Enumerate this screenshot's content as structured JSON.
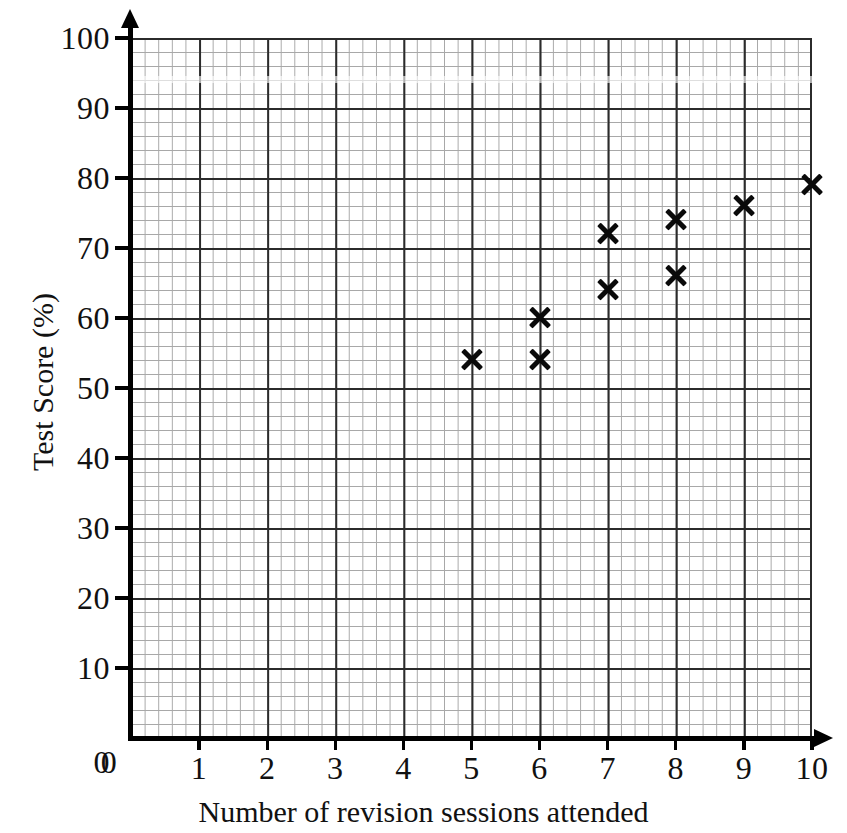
{
  "chart_data": {
    "type": "scatter",
    "title": "",
    "xlabel": "Number of revision sessions attended",
    "ylabel": "Test Score (%)",
    "xlim": [
      0,
      10
    ],
    "ylim": [
      0,
      100
    ],
    "x_ticks": [
      "0",
      "1",
      "2",
      "3",
      "4",
      "5",
      "6",
      "7",
      "8",
      "9",
      "10"
    ],
    "x_tick_values": [
      0,
      1,
      2,
      3,
      4,
      5,
      6,
      7,
      8,
      9,
      10
    ],
    "y_ticks": [
      "0",
      "10",
      "20",
      "30",
      "40",
      "50",
      "60",
      "70",
      "80",
      "90",
      "100"
    ],
    "y_tick_values": [
      0,
      10,
      20,
      30,
      40,
      50,
      60,
      70,
      80,
      90,
      100
    ],
    "grid": true,
    "grid_minor_x_step": 0.2,
    "grid_minor_y_step": 2,
    "grid_major_x_step": 1,
    "grid_major_y_step": 10,
    "legend": null,
    "marker": "x",
    "marker_color": "#0a0a0a",
    "points": [
      {
        "x": 5,
        "y": 54
      },
      {
        "x": 6,
        "y": 54
      },
      {
        "x": 6,
        "y": 60
      },
      {
        "x": 7,
        "y": 64
      },
      {
        "x": 7,
        "y": 72
      },
      {
        "x": 8,
        "y": 66
      },
      {
        "x": 8,
        "y": 74
      },
      {
        "x": 9,
        "y": 76
      },
      {
        "x": 10,
        "y": 79
      }
    ],
    "series": [
      {
        "name": "Students",
        "x": [
          5,
          6,
          6,
          7,
          7,
          8,
          8,
          9,
          10
        ],
        "values": [
          54,
          54,
          60,
          64,
          72,
          66,
          74,
          76,
          79
        ]
      }
    ]
  },
  "colors": {
    "background": "#ffffff",
    "axis": "#000000",
    "grid_major": "#2b2b2b",
    "grid_minor": "#a8a8a8",
    "marker": "#0a0a0a",
    "text": "#111111"
  }
}
